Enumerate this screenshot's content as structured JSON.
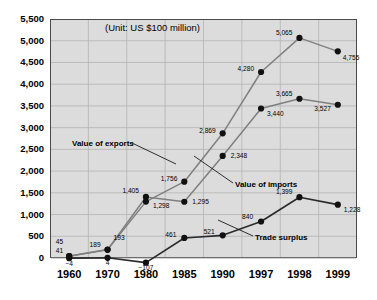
{
  "chart_data": {
    "type": "line",
    "title": "(Unit:  US $100 million)",
    "xlabel": "",
    "ylabel": "",
    "categories": [
      "1960",
      "1970",
      "1980",
      "1985",
      "1990",
      "1997",
      "1998",
      "1999"
    ],
    "ylim": [
      0,
      5500
    ],
    "yticks": [
      "0",
      "500",
      "1,000",
      "1,500",
      "2,000",
      "2,500",
      "3,000",
      "3,500",
      "4,000",
      "4,500",
      "5,000",
      "5,500"
    ],
    "ytick_values": [
      0,
      500,
      1000,
      1500,
      2000,
      2500,
      3000,
      3500,
      4000,
      4500,
      5000,
      5500
    ],
    "grid": true,
    "legend_position": "inline-annotations",
    "series": [
      {
        "name": "Value of exports",
        "values": [
          45,
          193,
          1298,
          1756,
          2869,
          4280,
          5065,
          4755
        ],
        "labels": [
          "45",
          "193",
          "1,298",
          "1,756",
          "2,869",
          "4,280",
          "5,065",
          "4,755"
        ]
      },
      {
        "name": "Value of imports",
        "values": [
          41,
          189,
          1405,
          1295,
          2348,
          3440,
          3665,
          3527
        ],
        "labels": [
          "41",
          "189",
          "1,405",
          "1,295",
          "2,348",
          "3,440",
          "3,665",
          "3,527"
        ]
      },
      {
        "name": "Trade surplus",
        "values": [
          -4,
          4,
          -107,
          461,
          521,
          840,
          1399,
          1228
        ],
        "labels": [
          "−4",
          "4",
          "−107",
          "461",
          "521",
          "840",
          "1,399",
          "1,228"
        ]
      }
    ],
    "annotations": [
      {
        "text": "Value of exports",
        "target_series": "Value of exports"
      },
      {
        "text": "Value of imports",
        "target_series": "Value of imports"
      },
      {
        "text": "Trade surplus",
        "target_series": "Trade surplus"
      }
    ],
    "colors": {
      "plot_background": "#dcdcdc",
      "page_background": "#ffffff",
      "axis": "#4a4a4a",
      "gridline": "#b4b4b4",
      "exports_line": "#808080",
      "imports_line": "#808080",
      "surplus_line": "#2b2b2b",
      "marker": "#111111",
      "text": "#000000"
    }
  }
}
